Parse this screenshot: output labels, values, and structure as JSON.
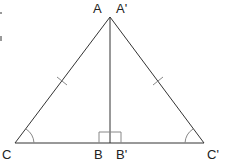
{
  "diagram": {
    "type": "geometry",
    "labels": {
      "A": "A",
      "A_prime": "A'",
      "B": "B",
      "B_prime": "B'",
      "C": "C",
      "C_prime": "C'"
    },
    "points": {
      "apex": [
        110,
        17
      ],
      "foot": [
        110,
        143
      ],
      "C": [
        15,
        143
      ],
      "C_prime": [
        204,
        143
      ]
    },
    "markings": {
      "equal_sides_ticks": 2,
      "equal_angle_arcs": 2,
      "right_angle_marker": true
    },
    "colors": {
      "line": "#333333",
      "marking": "#888888",
      "label": "#222222"
    }
  }
}
